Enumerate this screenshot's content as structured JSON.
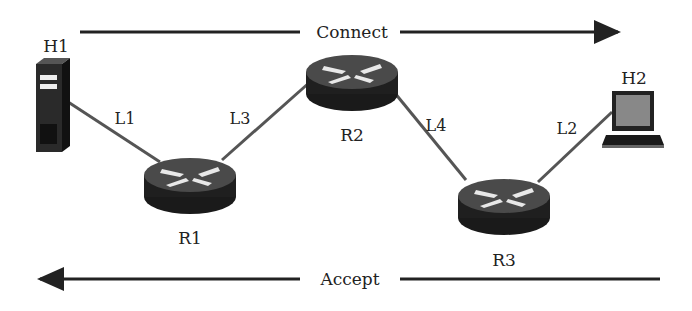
{
  "diagram": {
    "top_flow": {
      "label": "Connect",
      "direction": "right"
    },
    "bottom_flow": {
      "label": "Accept",
      "direction": "left"
    },
    "nodes": [
      {
        "id": "H1",
        "label": "H1",
        "type": "server"
      },
      {
        "id": "R1",
        "label": "R1",
        "type": "router"
      },
      {
        "id": "R2",
        "label": "R2",
        "type": "router"
      },
      {
        "id": "R3",
        "label": "R3",
        "type": "router"
      },
      {
        "id": "H2",
        "label": "H2",
        "type": "laptop"
      }
    ],
    "links": [
      {
        "label": "L1",
        "from": "H1",
        "to": "R1"
      },
      {
        "label": "L3",
        "from": "R1",
        "to": "R2"
      },
      {
        "label": "L4",
        "from": "R2",
        "to": "R3"
      },
      {
        "label": "L2",
        "from": "R3",
        "to": "H2"
      }
    ]
  }
}
